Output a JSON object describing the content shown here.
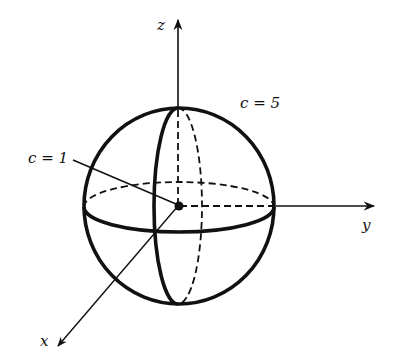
{
  "figure": {
    "axes": {
      "z_label": "z",
      "y_label": "y",
      "x_label": "x"
    },
    "annotations": [
      {
        "id": "inner",
        "label": "c = 1",
        "target": "center point (small sphere)"
      },
      {
        "id": "outer",
        "label": "c = 5",
        "target": "outer sphere"
      }
    ],
    "colors": {
      "ink": "#111111",
      "background": "#ffffff"
    }
  }
}
